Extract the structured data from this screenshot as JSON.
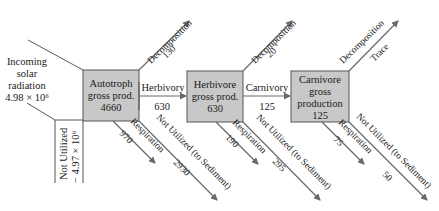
{
  "diagram": {
    "colors": {
      "box_fill": "#c8c8c8",
      "box_stroke": "#555555",
      "arrow": "#6a6a6a",
      "text": "#1a1a1a"
    },
    "input": {
      "line1": "Incoming",
      "line2": "solar",
      "line3": "radiation",
      "value": "4.98 × 10⁶"
    },
    "not_utilized_input": {
      "label": "Not Utilized",
      "value": "− 4.97 × 10⁶"
    },
    "nodes": [
      {
        "id": "autotroph",
        "lines": [
          "Autotroph",
          "gross prod.",
          "4660"
        ]
      },
      {
        "id": "herbivore",
        "lines": [
          "Herbivore",
          "gross prod.",
          "630"
        ]
      },
      {
        "id": "carnivore",
        "lines": [
          "Carnivore",
          "gross",
          "production",
          "125"
        ]
      }
    ],
    "transfers": [
      {
        "label": "Herbivory",
        "value": "630"
      },
      {
        "label": "Carnivory",
        "value": "125"
      }
    ],
    "decomposition": [
      {
        "label": "Decomposition",
        "value": "130"
      },
      {
        "label": "Decomposition",
        "value": "20"
      },
      {
        "label": "Decomposition",
        "value": "Trace"
      }
    ],
    "respiration": [
      {
        "label": "Respiration",
        "value": "970"
      },
      {
        "label": "Respiration",
        "value": "190"
      },
      {
        "label": "Respiration",
        "value": "75"
      }
    ],
    "not_utilized_sediment": [
      {
        "label": "Not Utilized (to Sediment)",
        "value": "2930"
      },
      {
        "label": "Not Utilized (to Sediment)",
        "value": "295"
      },
      {
        "label": "Not Utilized (to Sediment)",
        "value": "50"
      }
    ]
  }
}
